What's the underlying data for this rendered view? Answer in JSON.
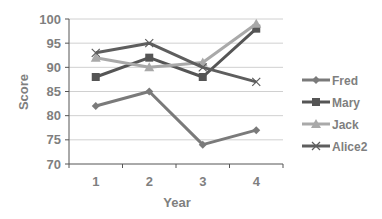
{
  "chart_data": {
    "type": "line",
    "title": "",
    "xlabel": "Year",
    "ylabel": "Score",
    "categories": [
      "1",
      "2",
      "3",
      "4"
    ],
    "ylim": [
      70,
      100
    ],
    "yticks": [
      70,
      75,
      80,
      85,
      90,
      95,
      100
    ],
    "grid": true,
    "legend_position": "right",
    "series": [
      {
        "name": "Fred",
        "values": [
          82,
          85,
          74,
          77
        ],
        "color": "#7a7a7a",
        "marker": "diamond"
      },
      {
        "name": "Mary",
        "values": [
          88,
          92,
          88,
          98
        ],
        "color": "#555555",
        "marker": "square"
      },
      {
        "name": "Jack",
        "values": [
          92,
          90,
          91,
          99
        ],
        "color": "#a9a9a9",
        "marker": "triangle"
      },
      {
        "name": "Alice2",
        "values": [
          93,
          95,
          90,
          87
        ],
        "color": "#5e5e5e",
        "marker": "x"
      }
    ]
  },
  "colors": {
    "gridline": "#d0d0d0",
    "axis": "#555555",
    "text": "#7f7f7f"
  }
}
